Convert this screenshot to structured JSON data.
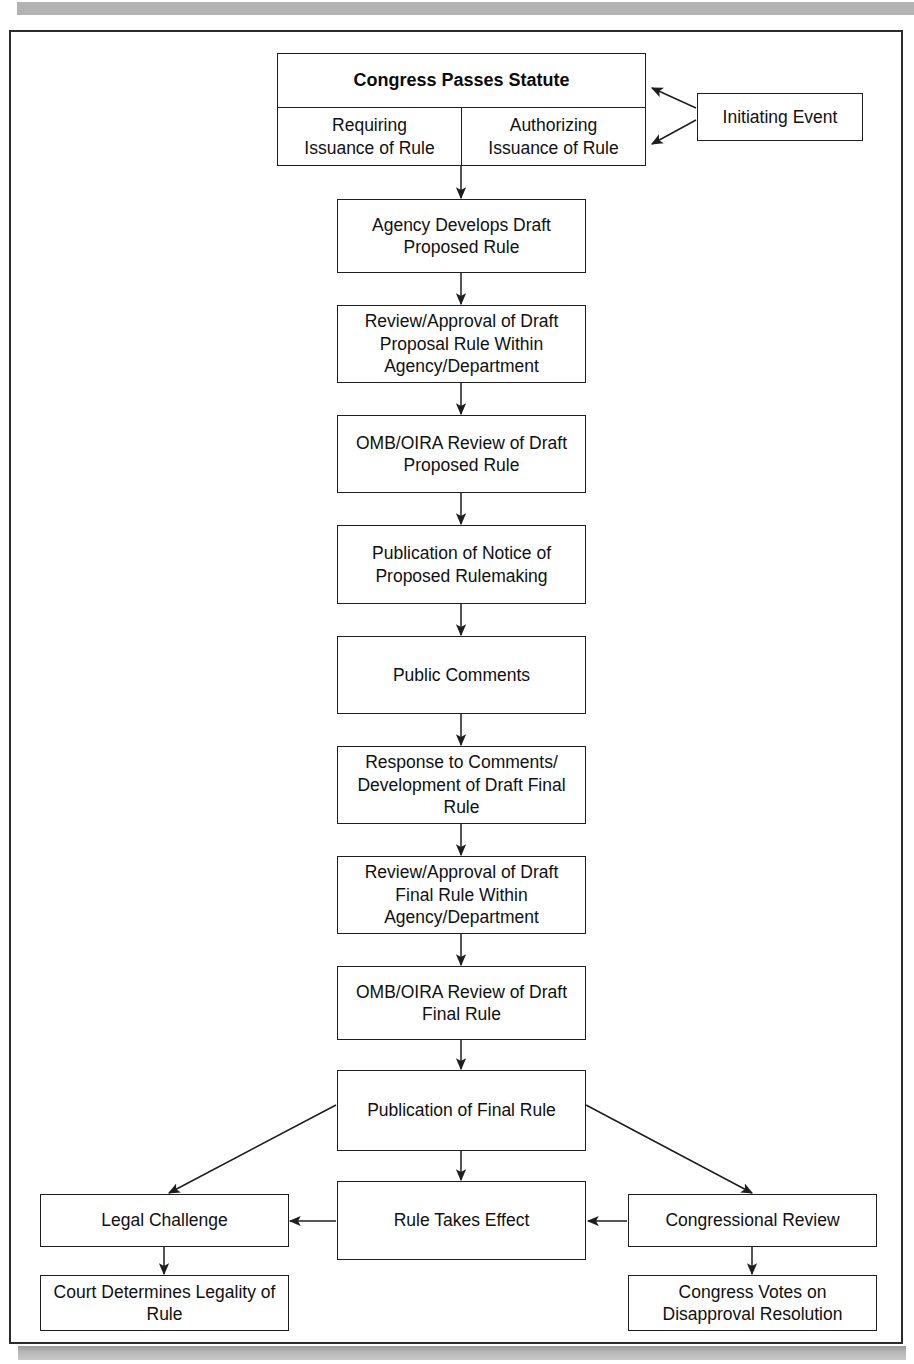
{
  "figure": {
    "type": "flowchart",
    "orientation": "top-to-bottom",
    "background_color": "#ffffff",
    "line_color": "#1e1e1e",
    "frame_color": "#2b2b2b",
    "scanbar_color": "#b3b3b3"
  },
  "nodes": {
    "congress_statute": {
      "title": "Congress Passes Statute",
      "left_column": "Requiring\nIssuance of Rule",
      "left_column_line1": "Requiring",
      "left_column_line2": "Issuance of Rule",
      "right_column_line1": "Authorizing",
      "right_column_line2": "Issuance of Rule"
    },
    "initiating_event": {
      "label": "Initiating Event"
    },
    "agency_draft": {
      "label": "Agency Develops Draft Proposed Rule"
    },
    "review_draft_proposal": {
      "label": "Review/Approval of Draft Proposal Rule Within Agency/Department"
    },
    "omb_review_proposed": {
      "label": "OMB/OIRA Review of Draft Proposed Rule"
    },
    "publication_nprm": {
      "label": "Publication of Notice of Proposed Rulemaking"
    },
    "public_comments": {
      "label": "Public Comments"
    },
    "response_comments": {
      "label": "Response to Comments/ Development of Draft Final Rule"
    },
    "review_draft_final": {
      "label": "Review/Approval of Draft Final Rule Within Agency/Department"
    },
    "omb_review_final": {
      "label": "OMB/OIRA Review of Draft Final Rule"
    },
    "publication_final": {
      "label": "Publication of Final Rule"
    },
    "legal_challenge": {
      "label": "Legal Challenge"
    },
    "rule_takes_effect": {
      "label": "Rule Takes Effect"
    },
    "congressional_review": {
      "label": "Congressional Review"
    },
    "court_determines": {
      "label": "Court Determines Legality of Rule"
    },
    "congress_votes": {
      "label": "Congress Votes on Disapproval Resolution"
    }
  },
  "edges": [
    {
      "from": "initiating_event",
      "to": "congress_statute",
      "label": ""
    },
    {
      "from": "congress_statute",
      "to": "agency_draft",
      "label": ""
    },
    {
      "from": "agency_draft",
      "to": "review_draft_proposal",
      "label": ""
    },
    {
      "from": "review_draft_proposal",
      "to": "omb_review_proposed",
      "label": ""
    },
    {
      "from": "omb_review_proposed",
      "to": "publication_nprm",
      "label": ""
    },
    {
      "from": "publication_nprm",
      "to": "public_comments",
      "label": ""
    },
    {
      "from": "public_comments",
      "to": "response_comments",
      "label": ""
    },
    {
      "from": "response_comments",
      "to": "review_draft_final",
      "label": ""
    },
    {
      "from": "review_draft_final",
      "to": "omb_review_final",
      "label": ""
    },
    {
      "from": "omb_review_final",
      "to": "publication_final",
      "label": ""
    },
    {
      "from": "publication_final",
      "to": "legal_challenge",
      "label": ""
    },
    {
      "from": "publication_final",
      "to": "rule_takes_effect",
      "label": ""
    },
    {
      "from": "publication_final",
      "to": "congressional_review",
      "label": ""
    },
    {
      "from": "rule_takes_effect",
      "to": "legal_challenge",
      "label": ""
    },
    {
      "from": "congressional_review",
      "to": "rule_takes_effect",
      "label": ""
    },
    {
      "from": "legal_challenge",
      "to": "court_determines",
      "label": ""
    },
    {
      "from": "congressional_review",
      "to": "congress_votes",
      "label": ""
    }
  ]
}
